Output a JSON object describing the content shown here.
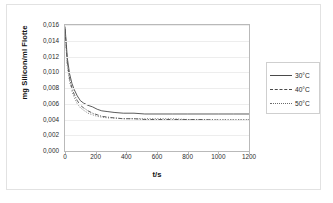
{
  "chart_data": {
    "type": "line",
    "title": "",
    "xlabel": "t/s",
    "ylabel": "mg Silicon/ml Flotte",
    "xlim": [
      0,
      1200
    ],
    "ylim": [
      0,
      0.016
    ],
    "grid": true,
    "legend_position": "right",
    "x_ticks": [
      "0",
      "200",
      "400",
      "600",
      "800",
      "1000",
      "1200"
    ],
    "x_tick_values": [
      0,
      200,
      400,
      600,
      800,
      1000,
      1200
    ],
    "y_ticks": [
      "0,000",
      "0,002",
      "0,004",
      "0,006",
      "0,008",
      "0,010",
      "0,012",
      "0,014",
      "0,016"
    ],
    "y_tick_values": [
      0.0,
      0.002,
      0.004,
      0.006,
      0.008,
      0.01,
      0.012,
      0.014,
      0.016
    ],
    "decimal_separator": ",",
    "series": [
      {
        "name": "30°C",
        "line_style": "solid",
        "color": "#4a4a4a",
        "x": [
          0,
          15,
          30,
          45,
          60,
          80,
          100,
          120,
          150,
          180,
          210,
          240,
          280,
          320,
          380,
          450,
          520,
          600,
          700,
          800,
          900,
          1000,
          1100,
          1200
        ],
        "y": [
          0.0158,
          0.0118,
          0.0098,
          0.0086,
          0.0078,
          0.007,
          0.0064,
          0.0061,
          0.0058,
          0.0056,
          0.0053,
          0.0051,
          0.005,
          0.0049,
          0.0048,
          0.0048,
          0.0047,
          0.0047,
          0.0047,
          0.0047,
          0.0047,
          0.0047,
          0.0047,
          0.0047
        ]
      },
      {
        "name": "40°C",
        "line_style": "dashdot",
        "color": "#4a4a4a",
        "x": [
          0,
          15,
          30,
          45,
          60,
          80,
          100,
          120,
          150,
          180,
          210,
          240,
          280,
          320,
          380,
          450,
          520,
          600,
          700,
          800,
          900,
          1000,
          1100,
          1200
        ],
        "y": [
          0.0155,
          0.0112,
          0.0092,
          0.008,
          0.0072,
          0.0064,
          0.0058,
          0.0055,
          0.0051,
          0.0048,
          0.0046,
          0.0044,
          0.0043,
          0.0042,
          0.0041,
          0.0041,
          0.004,
          0.004,
          0.004,
          0.004,
          0.004,
          0.0039,
          0.0039,
          0.0039
        ]
      },
      {
        "name": "50°C",
        "line_style": "dotted",
        "color": "#6a6a6a",
        "x": [
          0,
          15,
          30,
          45,
          60,
          80,
          100,
          120,
          150,
          180,
          210,
          240,
          280,
          320,
          380,
          450,
          520,
          600,
          700,
          800,
          900,
          1000,
          1100,
          1200
        ],
        "y": [
          0.0152,
          0.0108,
          0.0088,
          0.0076,
          0.0068,
          0.006,
          0.0055,
          0.0052,
          0.0048,
          0.0046,
          0.0044,
          0.0043,
          0.0042,
          0.0042,
          0.0041,
          0.0041,
          0.0041,
          0.0041,
          0.0041,
          0.004,
          0.004,
          0.004,
          0.004,
          0.004
        ]
      }
    ]
  }
}
